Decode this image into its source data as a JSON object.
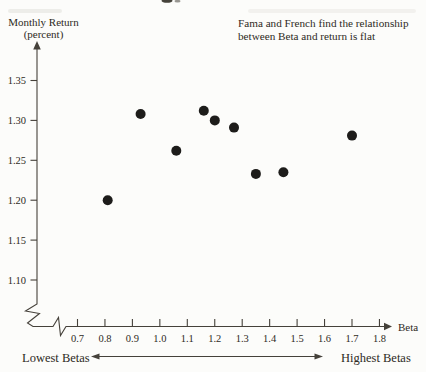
{
  "page": {
    "background": "#fcfcfa",
    "ink_color": "#2e2a24",
    "axis_color": "#45413a"
  },
  "annotation": {
    "line1": "Fama and French find the relationship",
    "line2": "between Beta and return is flat"
  },
  "chart_data": {
    "type": "scatter",
    "annotation": "Fama and French find the relationship between Beta and return is flat",
    "x_axis": {
      "title": "Beta",
      "tick_labels": [
        "0.7",
        "0.8",
        "0.9",
        "1.0",
        "1.1",
        "1.2",
        "1.3",
        "1.4",
        "1.5",
        "1.6",
        "1.7",
        "1.8"
      ],
      "range": [
        0.7,
        1.8
      ],
      "axis_break": true
    },
    "y_axis": {
      "title": "Monthly Return",
      "title_unit": "(percent)",
      "tick_labels": [
        "1.35",
        "1.30",
        "1.25",
        "1.20",
        "1.15",
        "1.10"
      ],
      "range": [
        1.1,
        1.35
      ],
      "axis_break": true
    },
    "footer": {
      "left": "Lowest Betas",
      "right": "Highest Betas"
    },
    "points": [
      {
        "beta": 0.81,
        "monthly_return": 1.2
      },
      {
        "beta": 0.93,
        "monthly_return": 1.308
      },
      {
        "beta": 1.06,
        "monthly_return": 1.262
      },
      {
        "beta": 1.16,
        "monthly_return": 1.312
      },
      {
        "beta": 1.2,
        "monthly_return": 1.3
      },
      {
        "beta": 1.27,
        "monthly_return": 1.291
      },
      {
        "beta": 1.35,
        "monthly_return": 1.233
      },
      {
        "beta": 1.45,
        "monthly_return": 1.235
      },
      {
        "beta": 1.7,
        "monthly_return": 1.281
      }
    ],
    "point_color": "#1d1c1a",
    "grid": false,
    "legend": false
  }
}
